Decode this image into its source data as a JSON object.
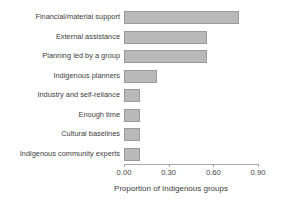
{
  "chart_data": {
    "type": "bar",
    "orientation": "horizontal",
    "title": "",
    "xlabel": "Proportion of Indigenous groups",
    "ylabel": "",
    "categories": [
      "Financial/material support",
      "External assistance",
      "Planning led by a group",
      "Indigenous planners",
      "Industry and self-reliance",
      "Enough time",
      "Cultural baselines",
      "Indigenous community experts"
    ],
    "values": [
      0.77,
      0.56,
      0.56,
      0.22,
      0.11,
      0.11,
      0.11,
      0.11
    ],
    "xlim": [
      0.0,
      0.9
    ],
    "xticks": [
      0.0,
      0.3,
      0.6,
      0.9
    ],
    "xtick_labels": [
      "0.00",
      "0.30",
      "0.60",
      "0.90"
    ],
    "grid": false,
    "legend": null,
    "bar_color": "#b9b9b9",
    "bar_edge_color": "#9a9a9a",
    "axis_color": "#a8a8a8",
    "text_color": "#3d3d3d"
  }
}
